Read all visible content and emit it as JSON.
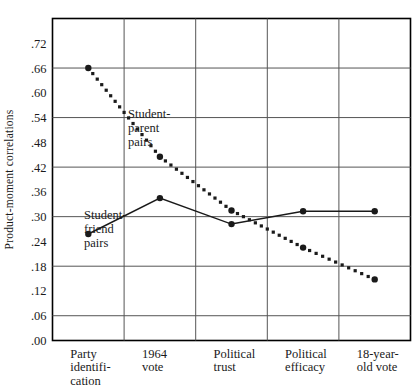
{
  "chart_data": {
    "type": "line",
    "title": "",
    "xlabel": "",
    "ylabel": "Product-moment correlations",
    "categories": [
      "Party identifi- cation",
      "1964 vote",
      "Political trust",
      "Political efficacy",
      "18-year- old vote"
    ],
    "category_lines": [
      [
        "Party",
        "identifi-",
        "cation"
      ],
      [
        "1964",
        "vote"
      ],
      [
        "Political",
        "trust"
      ],
      [
        "Political",
        "efficacy"
      ],
      [
        "18-year-",
        "old vote"
      ]
    ],
    "ylim": [
      0.0,
      0.78
    ],
    "yticks": [
      ".00",
      ".06",
      ".12",
      ".18",
      ".24",
      ".30",
      ".36",
      ".42",
      ".48",
      ".54",
      ".60",
      ".66",
      ".72"
    ],
    "ytick_values": [
      0.0,
      0.06,
      0.12,
      0.18,
      0.24,
      0.3,
      0.36,
      0.42,
      0.48,
      0.54,
      0.6,
      0.66,
      0.72
    ],
    "gridline_values": [
      0.06,
      0.18,
      0.3,
      0.42,
      0.54,
      0.66
    ],
    "grid": true,
    "legend_position": "inline-annotations",
    "series": [
      {
        "name": "Student-parent pairs",
        "style": "dotted",
        "marker": "filled-circle",
        "values": [
          0.66,
          0.445,
          0.315,
          0.225,
          0.148
        ]
      },
      {
        "name": "Student-friend pairs",
        "style": "solid",
        "marker": "filled-circle",
        "values": [
          0.258,
          0.345,
          0.282,
          0.313,
          0.313
        ]
      }
    ],
    "annotations": [
      {
        "name": "student-parent-label",
        "lines": [
          "Student-",
          "parent",
          "pairs"
        ],
        "x": 128,
        "y": 118
      },
      {
        "name": "student-friend-label",
        "lines": [
          "Student-",
          "friend",
          "pairs"
        ],
        "x": 84,
        "y": 219
      }
    ],
    "colors": {
      "line": "#1a1a1a",
      "grid": "#555555",
      "axis": "#000000",
      "background": "#ffffff"
    }
  }
}
